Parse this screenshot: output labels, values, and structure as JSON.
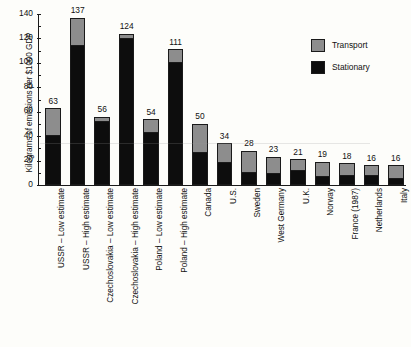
{
  "chart_data": {
    "type": "bar",
    "subtype": "stacked-vertical",
    "title": "",
    "xlabel": "",
    "ylabel": "Kilograms of emissions per $1000 GDP",
    "ylim": [
      0,
      140
    ],
    "ytick_values": [
      0,
      20,
      40,
      60,
      80,
      100,
      120,
      140
    ],
    "ytick_labels": [
      "0",
      "20",
      "40",
      "60",
      "80",
      "100",
      "120",
      "140"
    ],
    "grid": false,
    "legend_position": "top-right",
    "categories": [
      "USSR – Low estimate",
      "USSR – High estimate",
      "Czechoslovakia – Low estimate",
      "Czechoslovakia – High estimate",
      "Poland – Low estimate",
      "Poland – High estimate",
      "Canada",
      "U.S.",
      "Sweden",
      "West Germany",
      "U.K.",
      "Norway",
      "France (1987)",
      "Netherlands",
      "Italy"
    ],
    "series": [
      {
        "name": "Stationary",
        "color": "#0d0d0d",
        "values": [
          41,
          115,
          52,
          120,
          43,
          101,
          27,
          19,
          11,
          10,
          12,
          7,
          8,
          8,
          6
        ]
      },
      {
        "name": "Transport",
        "color": "#8d8d8d",
        "values": [
          22,
          22,
          4,
          4,
          11,
          10,
          23,
          15,
          17,
          13,
          9,
          12,
          10,
          8,
          10
        ]
      }
    ],
    "totals": [
      63,
      137,
      56,
      124,
      54,
      111,
      50,
      34,
      28,
      23,
      21,
      19,
      18,
      16,
      16
    ],
    "total_labels": [
      "63",
      "137",
      "56",
      "124",
      "54",
      "111",
      "50",
      "34",
      "28",
      "23",
      "21",
      "19",
      "18",
      "16",
      "16"
    ]
  },
  "legend": {
    "entries": [
      {
        "label": "Transport",
        "color": "#8d8d8d"
      },
      {
        "label": "Stationary",
        "color": "#0d0d0d"
      }
    ]
  }
}
